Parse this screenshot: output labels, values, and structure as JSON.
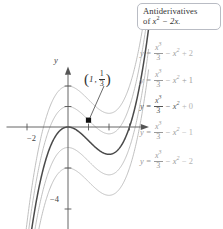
{
  "figure": {
    "title_box": {
      "line1": "Antiderivatives",
      "line2_prefix": "of ",
      "line2_expr_base": "x",
      "line2_expr_exp": "2",
      "line2_expr_rest": " − 2x."
    },
    "axes": {
      "y_axis_label": "y",
      "x_tick_labels": [
        "−2"
      ],
      "y_tick_labels": [
        "−4"
      ],
      "x_ticks": [
        -2,
        1,
        2,
        3
      ],
      "y_ticks": [
        -4,
        -2,
        1,
        2
      ],
      "xlim": [
        -2.9,
        3.9
      ],
      "ylim": [
        -5.2,
        3.1
      ]
    },
    "point": {
      "label_open": "(",
      "x_value": "1",
      "comma": ",",
      "frac_num": "1",
      "frac_den": "3",
      "label_close": ")",
      "coords": [
        1,
        0.3333
      ]
    },
    "equations": [
      {
        "lhs": "y =",
        "num": "x",
        "num_exp": "3",
        "den": "3",
        "mid": "− x",
        "mid_exp": "2",
        "c": "+ 2",
        "faint": true,
        "c_faint": true
      },
      {
        "lhs": "y =",
        "num": "x",
        "num_exp": "3",
        "den": "3",
        "mid": "− x",
        "mid_exp": "2",
        "c": "+ 1",
        "faint": true,
        "c_faint": false
      },
      {
        "lhs": "y =",
        "num": "x",
        "num_exp": "3",
        "den": "3",
        "mid": "− x",
        "mid_exp": "2",
        "c": "+ 0",
        "faint": false,
        "c_faint": true
      },
      {
        "lhs": "y =",
        "num": "x",
        "num_exp": "3",
        "den": "3",
        "mid": "− x",
        "mid_exp": "2",
        "c": "− 1",
        "faint": true,
        "c_faint": true
      },
      {
        "lhs": "y =",
        "num": "x",
        "num_exp": "3",
        "den": "3",
        "mid": "− x",
        "mid_exp": "2",
        "c": "− 2",
        "faint": true,
        "c_faint": true
      }
    ]
  },
  "chart_data": {
    "type": "line",
    "xlabel": "",
    "ylabel": "y",
    "xlim": [
      -2.9,
      3.9
    ],
    "ylim": [
      -5.2,
      3.1
    ],
    "grid": false,
    "legend": "right",
    "function_family": "y = x^3/3 - x^2 + C",
    "x_ticks": [
      -2,
      1,
      2,
      3
    ],
    "x_tick_labels": [
      "-2",
      "",
      "",
      ""
    ],
    "y_ticks": [
      -4,
      -2,
      1,
      2
    ],
    "y_tick_labels": [
      "-4",
      "",
      "",
      ""
    ],
    "annotations": [
      {
        "text": "(1, 1/3)",
        "x": 1,
        "y": 0.3333,
        "marker": "square",
        "highlighted": true
      }
    ],
    "series": [
      {
        "name": "y = x^3/3 - x^2 + 2",
        "C": 2,
        "color": "#b5b5b5",
        "highlighted": false
      },
      {
        "name": "y = x^3/3 - x^2 + 1",
        "C": 1,
        "color": "#b5b5b5",
        "highlighted": false
      },
      {
        "name": "y = x^3/3 - x^2 + 0",
        "C": 0,
        "color": "#4a4a4a",
        "highlighted": true
      },
      {
        "name": "y = x^3/3 - x^2 - 1",
        "C": -1,
        "color": "#b5b5b5",
        "highlighted": false
      },
      {
        "name": "y = x^3/3 - x^2 - 2",
        "C": -2,
        "color": "#b5b5b5",
        "highlighted": false
      }
    ]
  }
}
